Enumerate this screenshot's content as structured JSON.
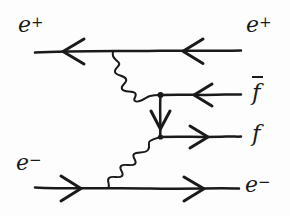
{
  "diagram": {
    "type": "feynman-diagram",
    "ink_color": "#1a1a1a",
    "background_color": "#fdfdfd",
    "labels": {
      "top_left": {
        "symbol": "e",
        "superscript": "+",
        "text": "e+"
      },
      "top_right": {
        "symbol": "e",
        "superscript": "+",
        "text": "e+"
      },
      "middle_upper": {
        "symbol": "f",
        "overbar": true,
        "text": "f-bar"
      },
      "middle_lower": {
        "symbol": "f",
        "overbar": false,
        "text": "f"
      },
      "bottom_left": {
        "symbol": "e",
        "superscript": "−",
        "text": "e-"
      },
      "bottom_right": {
        "symbol": "e",
        "superscript": "−",
        "text": "e-"
      }
    },
    "lines": [
      {
        "name": "positron-line",
        "particle": "e+",
        "style": "fermion",
        "direction": "left",
        "y": 51,
        "x1": 35,
        "x2": 241
      },
      {
        "name": "fbar-line",
        "particle": "f-bar",
        "style": "fermion",
        "direction": "left",
        "y": 95,
        "x1": 160,
        "x2": 241
      },
      {
        "name": "f-line",
        "particle": "f",
        "style": "fermion",
        "direction": "right",
        "y": 137,
        "x1": 160,
        "x2": 241
      },
      {
        "name": "electron-line",
        "particle": "e-",
        "style": "fermion",
        "direction": "right",
        "y": 188,
        "x1": 35,
        "x2": 239
      },
      {
        "name": "internal-fermion-line",
        "particle": "f",
        "style": "fermion",
        "direction": "down",
        "x": 160,
        "y1": 95,
        "y2": 137
      }
    ],
    "photons": [
      {
        "name": "upper-photon",
        "style": "wavy",
        "from": [
          113,
          52
        ],
        "to": [
          160,
          95
        ]
      },
      {
        "name": "lower-photon",
        "style": "wavy",
        "from": [
          108,
          188
        ],
        "to": [
          160,
          137
        ]
      }
    ],
    "vertices": [
      {
        "name": "vertex-top-left",
        "x": 113,
        "y": 51
      },
      {
        "name": "vertex-upper-center",
        "x": 160,
        "y": 95
      },
      {
        "name": "vertex-lower-center",
        "x": 160,
        "y": 137
      },
      {
        "name": "vertex-bottom-left",
        "x": 108,
        "y": 188
      }
    ],
    "arrows": [
      {
        "name": "arrow-positron-left",
        "x": 70,
        "y": 51,
        "direction": "left"
      },
      {
        "name": "arrow-positron-right",
        "x": 190,
        "y": 51,
        "direction": "left"
      },
      {
        "name": "arrow-fbar",
        "x": 200,
        "y": 95,
        "direction": "left"
      },
      {
        "name": "arrow-internal",
        "x": 160,
        "y": 122,
        "direction": "down"
      },
      {
        "name": "arrow-f",
        "x": 200,
        "y": 137,
        "direction": "right"
      },
      {
        "name": "arrow-electron-left",
        "x": 75,
        "y": 188,
        "direction": "right"
      },
      {
        "name": "arrow-electron-right",
        "x": 198,
        "y": 188,
        "direction": "right"
      }
    ]
  }
}
